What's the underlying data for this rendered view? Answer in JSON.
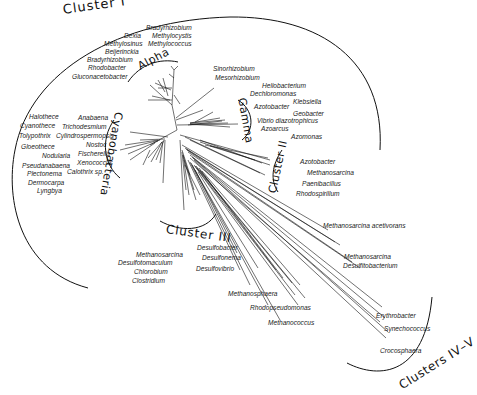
{
  "diagram": {
    "type": "unrooted phylogenetic tree",
    "clusters": [
      {
        "label": "Cluster I",
        "x": 64,
        "y": 8,
        "size": 13,
        "rot": -8
      },
      {
        "label": "Alpha",
        "x": 140,
        "y": 57,
        "size": 11,
        "rot": -28
      },
      {
        "label": "Gamma",
        "x": 238,
        "y": 105,
        "size": 11,
        "rot": 80
      },
      {
        "label": "Cyanobacteria",
        "x": 113,
        "y": 127,
        "size": 11,
        "rot": 102
      },
      {
        "label": "Cluster II",
        "x": 267,
        "y": 186,
        "size": 11,
        "rot": -78
      },
      {
        "label": "Cluster III",
        "x": 168,
        "y": 227,
        "size": 12,
        "rot": 8
      },
      {
        "label": "Clusters IV–V",
        "x": 398,
        "y": 392,
        "size": 12,
        "rot": -30
      }
    ],
    "taxa": {
      "cluster1": [
        {
          "name": "Bradyrhizobium",
          "x": 146,
          "y": 25
        },
        {
          "name": "Dexia",
          "x": 124,
          "y": 32
        },
        {
          "name": "Methylocystis",
          "x": 151,
          "y": 32
        },
        {
          "name": "Methylosinus",
          "x": 104,
          "y": 40
        },
        {
          "name": "Methylococcus",
          "x": 147,
          "y": 40
        },
        {
          "name": "Beijerinckia",
          "x": 104,
          "y": 48
        },
        {
          "name": "Bradyrhizobium",
          "x": 87,
          "y": 57
        },
        {
          "name": "Rhodobacter",
          "x": 87,
          "y": 65
        },
        {
          "name": "Gluconacetobacter",
          "x": 71,
          "y": 75
        }
      ],
      "alpha_misc": [
        {
          "name": "Sinorhizobium",
          "x": 212,
          "y": 68
        },
        {
          "name": "Mesorhizobium",
          "x": 214,
          "y": 77
        }
      ],
      "gamma": [
        {
          "name": "Heliobacterium",
          "x": 261,
          "y": 84
        },
        {
          "name": "Dechloromonas",
          "x": 249,
          "y": 92
        },
        {
          "name": "Klebsiella",
          "x": 292,
          "y": 100
        },
        {
          "name": "Azotobacter",
          "x": 252,
          "y": 105
        },
        {
          "name": "Geobacter",
          "x": 292,
          "y": 112
        },
        {
          "name": "Vibrio diazotrophicus",
          "x": 257,
          "y": 119
        },
        {
          "name": "Azoarcus",
          "x": 260,
          "y": 127
        },
        {
          "name": "Azomonas",
          "x": 290,
          "y": 136
        }
      ],
      "cyanobacteria": [
        {
          "name": "Halothece",
          "x": 29,
          "y": 116
        },
        {
          "name": "Anabaena",
          "x": 78,
          "y": 117
        },
        {
          "name": "Cyanothece",
          "x": 20,
          "y": 125
        },
        {
          "name": "Trichodesmium",
          "x": 62,
          "y": 125
        },
        {
          "name": "Tolypothrix",
          "x": 19,
          "y": 134
        },
        {
          "name": "Cylindrospermopsis",
          "x": 56,
          "y": 134
        },
        {
          "name": "Gloeothece",
          "x": 21,
          "y": 145
        },
        {
          "name": "Nostoc",
          "x": 86,
          "y": 143
        },
        {
          "name": "Nodularia",
          "x": 42,
          "y": 154
        },
        {
          "name": "Fischerella",
          "x": 78,
          "y": 152
        },
        {
          "name": "Xenococcus",
          "x": 77,
          "y": 161
        },
        {
          "name": "Pseudanabaena",
          "x": 22,
          "y": 164
        },
        {
          "name": "Calothrix sp.",
          "x": 67,
          "y": 170
        },
        {
          "name": "Plectonema",
          "x": 27,
          "y": 172
        },
        {
          "name": "Dermocarpa",
          "x": 28,
          "y": 180
        },
        {
          "name": "Lyngbya",
          "x": 38,
          "y": 189
        }
      ],
      "cluster2": [
        {
          "name": "Azotobacter",
          "x": 300,
          "y": 160
        },
        {
          "name": "Methanosarcina",
          "x": 307,
          "y": 171
        },
        {
          "name": "Paenibacillus",
          "x": 302,
          "y": 182
        },
        {
          "name": "Rhodospirillum",
          "x": 296,
          "y": 192
        }
      ],
      "cluster3": [
        {
          "name": "Desulfobacter",
          "x": 197,
          "y": 246
        },
        {
          "name": "Methanosarcina",
          "x": 136,
          "y": 253
        },
        {
          "name": "Desulfonema",
          "x": 202,
          "y": 256
        },
        {
          "name": "Desulfotomaculum",
          "x": 119,
          "y": 261
        },
        {
          "name": "Desulfovibrio",
          "x": 196,
          "y": 267
        },
        {
          "name": "Chlorobium",
          "x": 134,
          "y": 270
        },
        {
          "name": "Clostridium",
          "x": 132,
          "y": 279
        }
      ],
      "cluster4_5": [
        {
          "name": "Methanosarcina acetivorans",
          "x": 322,
          "y": 224
        },
        {
          "name": "Methanosarcina",
          "x": 344,
          "y": 255
        },
        {
          "name": "Desulfitobacterium",
          "x": 343,
          "y": 264
        },
        {
          "name": "Methanosphaera",
          "x": 228,
          "y": 292
        },
        {
          "name": "Rhodopseudomonas",
          "x": 250,
          "y": 305
        },
        {
          "name": "Erythrobacter",
          "x": 376,
          "y": 314
        },
        {
          "name": "Methanococcus",
          "x": 268,
          "y": 321
        },
        {
          "name": "Synechococcus",
          "x": 383,
          "y": 327
        },
        {
          "name": "Crocosphaera",
          "x": 380,
          "y": 350
        }
      ]
    },
    "colors": {
      "line": "#111111",
      "text": "#222222",
      "background": "#ffffff"
    }
  }
}
